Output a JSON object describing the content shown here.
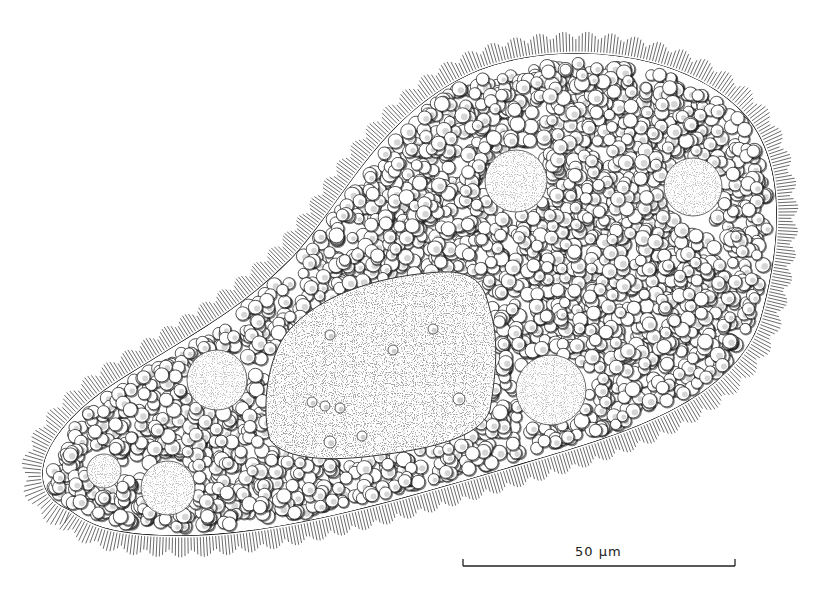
{
  "figure": {
    "background": "#ffffff",
    "ink": "#1a1a1a"
  },
  "scale_bar": {
    "label": "50 μm",
    "x1": 463,
    "x2": 735,
    "y": 566,
    "tick": 7
  },
  "body": {
    "outline": "M 70 510 C 20 490, 40 430, 120 380 C 200 330, 240 310, 290 260 C 340 210, 380 110, 480 70 C 560 40, 680 50, 740 110 C 790 160, 780 250, 760 320 C 730 410, 600 440, 500 470 C 380 505, 260 540, 160 535 C 110 533, 90 525, 70 510 Z",
    "cilia_length": 16,
    "cilia_count": 620
  },
  "granules": {
    "count": 2600,
    "min_r": 5,
    "max_r": 7.5,
    "seed": 7
  },
  "macronucleus": {
    "outline": "M 285 335 C 320 290, 390 275, 440 272 C 480 270, 485 290, 490 310 C 500 340, 495 380, 490 410 C 480 440, 420 450, 380 455 C 330 462, 285 460, 270 440 C 262 415, 265 365, 285 335 Z",
    "inclusions": [
      [
        330,
        335,
        5
      ],
      [
        393,
        350,
        5
      ],
      [
        433,
        329,
        5
      ],
      [
        312,
        402,
        5
      ],
      [
        325,
        406,
        5
      ],
      [
        340,
        408,
        5
      ],
      [
        459,
        399,
        6
      ],
      [
        362,
        436,
        5
      ],
      [
        330,
        442,
        6
      ]
    ]
  },
  "vacuoles": [
    {
      "name": "vacuole-top-center",
      "cx": 516,
      "cy": 181,
      "r": 31
    },
    {
      "name": "vacuole-top-right",
      "cx": 693,
      "cy": 187,
      "r": 29
    },
    {
      "name": "vacuole-mid-right",
      "cx": 551,
      "cy": 390,
      "r": 35
    },
    {
      "name": "vacuole-mid-left",
      "cx": 217,
      "cy": 380,
      "r": 30
    },
    {
      "name": "vacuole-lower-left",
      "cx": 168,
      "cy": 488,
      "r": 27
    },
    {
      "name": "vacuole-tip",
      "cx": 104,
      "cy": 471,
      "r": 17
    }
  ]
}
